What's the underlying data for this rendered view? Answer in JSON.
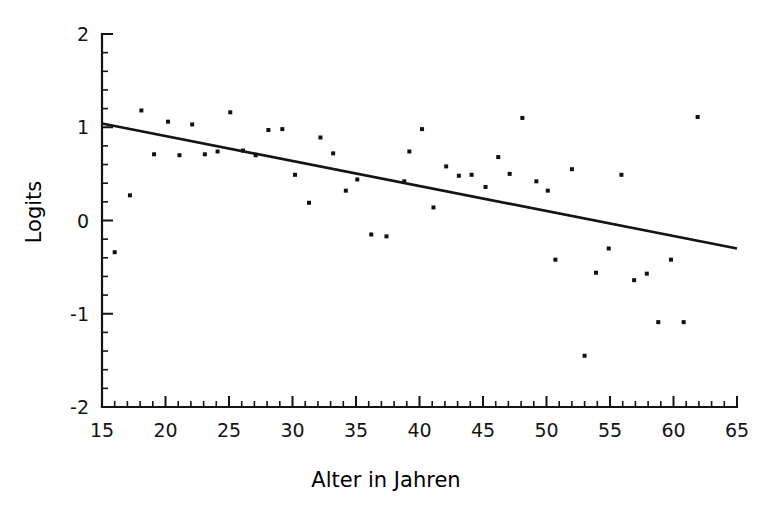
{
  "chart_data": {
    "type": "scatter",
    "title": "",
    "xlabel": "Alter in Jahren",
    "ylabel": "Logits",
    "xlim": [
      15,
      65
    ],
    "ylim": [
      -2,
      2
    ],
    "xticks": [
      15,
      20,
      25,
      30,
      35,
      40,
      45,
      50,
      55,
      60,
      65
    ],
    "yticks": [
      -2,
      -1,
      0,
      1,
      2
    ],
    "xtick_labels": [
      "15",
      "20",
      "25",
      "30",
      "35",
      "40",
      "45",
      "50",
      "55",
      "60",
      "65"
    ],
    "ytick_labels": [
      "-2",
      "-1",
      "0",
      "1",
      "2"
    ],
    "minor_tick_step_x": 1,
    "minor_tick_step_y": 0.2,
    "grid": false,
    "legend": null,
    "marker": "square",
    "marker_color": "#111111",
    "marker_size": 4,
    "points": [
      {
        "x": 16.0,
        "y": -0.34
      },
      {
        "x": 17.2,
        "y": 0.27
      },
      {
        "x": 18.1,
        "y": 1.18
      },
      {
        "x": 19.1,
        "y": 0.71
      },
      {
        "x": 20.2,
        "y": 1.06
      },
      {
        "x": 21.1,
        "y": 0.7
      },
      {
        "x": 22.1,
        "y": 1.03
      },
      {
        "x": 23.1,
        "y": 0.71
      },
      {
        "x": 24.1,
        "y": 0.74
      },
      {
        "x": 25.1,
        "y": 1.16
      },
      {
        "x": 26.1,
        "y": 0.75
      },
      {
        "x": 27.1,
        "y": 0.7
      },
      {
        "x": 28.1,
        "y": 0.97
      },
      {
        "x": 29.2,
        "y": 0.98
      },
      {
        "x": 30.2,
        "y": 0.49
      },
      {
        "x": 31.3,
        "y": 0.19
      },
      {
        "x": 32.2,
        "y": 0.89
      },
      {
        "x": 33.2,
        "y": 0.72
      },
      {
        "x": 34.2,
        "y": 0.32
      },
      {
        "x": 35.1,
        "y": 0.44
      },
      {
        "x": 36.2,
        "y": -0.15
      },
      {
        "x": 37.4,
        "y": -0.17
      },
      {
        "x": 38.8,
        "y": 0.42
      },
      {
        "x": 39.2,
        "y": 0.74
      },
      {
        "x": 40.2,
        "y": 0.98
      },
      {
        "x": 41.1,
        "y": 0.14
      },
      {
        "x": 42.1,
        "y": 0.58
      },
      {
        "x": 43.1,
        "y": 0.48
      },
      {
        "x": 44.1,
        "y": 0.49
      },
      {
        "x": 45.2,
        "y": 0.36
      },
      {
        "x": 46.2,
        "y": 0.68
      },
      {
        "x": 47.1,
        "y": 0.5
      },
      {
        "x": 48.1,
        "y": 1.1
      },
      {
        "x": 49.2,
        "y": 0.42
      },
      {
        "x": 50.1,
        "y": 0.32
      },
      {
        "x": 50.7,
        "y": -0.42
      },
      {
        "x": 52.0,
        "y": 0.55
      },
      {
        "x": 53.0,
        "y": -1.45
      },
      {
        "x": 53.9,
        "y": -0.56
      },
      {
        "x": 54.9,
        "y": -0.3
      },
      {
        "x": 55.9,
        "y": 0.49
      },
      {
        "x": 56.9,
        "y": -0.64
      },
      {
        "x": 57.9,
        "y": -0.57
      },
      {
        "x": 58.8,
        "y": -1.09
      },
      {
        "x": 59.8,
        "y": -0.42
      },
      {
        "x": 60.8,
        "y": -1.09
      },
      {
        "x": 61.9,
        "y": 1.11
      }
    ],
    "fit_line": {
      "x0": 15,
      "y0": 1.04,
      "x1": 65,
      "y1": -0.3,
      "color": "#141414"
    }
  }
}
